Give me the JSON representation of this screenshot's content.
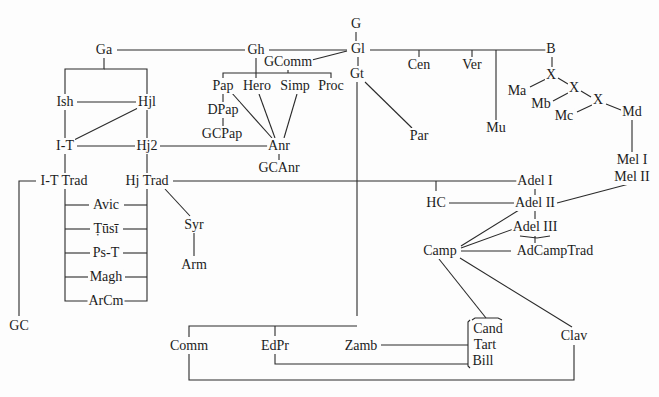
{
  "diagram": {
    "type": "stemma",
    "nodes": [
      {
        "id": "G",
        "label": "G",
        "x": 356,
        "y": 24
      },
      {
        "id": "Gl",
        "label": "Gl",
        "x": 358,
        "y": 49
      },
      {
        "id": "Gt",
        "label": "Gt",
        "x": 357,
        "y": 74
      },
      {
        "id": "Ga",
        "label": "Ga",
        "x": 104,
        "y": 50
      },
      {
        "id": "Gh",
        "label": "Gh",
        "x": 256,
        "y": 50
      },
      {
        "id": "GComm",
        "label": "GComm",
        "x": 288,
        "y": 62
      },
      {
        "id": "Cen",
        "label": "Cen",
        "x": 419,
        "y": 65
      },
      {
        "id": "Ver",
        "label": "Ver",
        "x": 472,
        "y": 65
      },
      {
        "id": "B",
        "label": "B",
        "x": 551,
        "y": 49
      },
      {
        "id": "X1",
        "label": "X",
        "x": 551,
        "y": 75
      },
      {
        "id": "X2",
        "label": "X",
        "x": 574,
        "y": 88
      },
      {
        "id": "X3",
        "label": "X",
        "x": 598,
        "y": 100
      },
      {
        "id": "Ma",
        "label": "Ma",
        "x": 517,
        "y": 91
      },
      {
        "id": "Mb",
        "label": "Mb",
        "x": 541,
        "y": 104
      },
      {
        "id": "Mc",
        "label": "Mc",
        "x": 564,
        "y": 116
      },
      {
        "id": "Md",
        "label": "Md",
        "x": 632,
        "y": 112
      },
      {
        "id": "Mu",
        "label": "Mu",
        "x": 496,
        "y": 128
      },
      {
        "id": "Par",
        "label": "Par",
        "x": 419,
        "y": 136
      },
      {
        "id": "MelI",
        "label": "Mel I",
        "x": 632,
        "y": 160
      },
      {
        "id": "MelII",
        "label": "Mel II",
        "x": 632,
        "y": 177
      },
      {
        "id": "Pap",
        "label": "Pap",
        "x": 223,
        "y": 86
      },
      {
        "id": "Hero",
        "label": "Hero",
        "x": 257,
        "y": 86
      },
      {
        "id": "Simp",
        "label": "Simp",
        "x": 295,
        "y": 86
      },
      {
        "id": "Proc",
        "label": "Proc",
        "x": 331,
        "y": 86
      },
      {
        "id": "DPap",
        "label": "DPap",
        "x": 223,
        "y": 110
      },
      {
        "id": "GCPap",
        "label": "GCPap",
        "x": 222,
        "y": 134
      },
      {
        "id": "Anr",
        "label": "Anr",
        "x": 279,
        "y": 146
      },
      {
        "id": "GCAnr",
        "label": "GCAnr",
        "x": 279,
        "y": 168
      },
      {
        "id": "Ish",
        "label": "Ish",
        "x": 65,
        "y": 102
      },
      {
        "id": "Hjl",
        "label": "Hjl",
        "x": 147,
        "y": 102
      },
      {
        "id": "IT",
        "label": "I-T",
        "x": 65,
        "y": 146
      },
      {
        "id": "Hj2",
        "label": "Hj2",
        "x": 147,
        "y": 146
      },
      {
        "id": "ITTrad",
        "label": "I-T  Trad",
        "x": 64,
        "y": 181
      },
      {
        "id": "HjTrad",
        "label": "Hj  Trad",
        "x": 147,
        "y": 181
      },
      {
        "id": "Avic",
        "label": "Avic",
        "x": 106,
        "y": 205
      },
      {
        "id": "Tusi",
        "label": "Ṭūsī",
        "x": 106,
        "y": 229
      },
      {
        "id": "PsT",
        "label": "Ps-T",
        "x": 106,
        "y": 253
      },
      {
        "id": "Magh",
        "label": "Magh",
        "x": 106,
        "y": 277
      },
      {
        "id": "ArCm",
        "label": "ArCm",
        "x": 106,
        "y": 301
      },
      {
        "id": "Syr",
        "label": "Syr",
        "x": 194,
        "y": 225
      },
      {
        "id": "Arm",
        "label": "Arm",
        "x": 194,
        "y": 265
      },
      {
        "id": "GC",
        "label": "GC",
        "x": 19,
        "y": 326
      },
      {
        "id": "AdelI",
        "label": "Adel  I",
        "x": 535,
        "y": 181
      },
      {
        "id": "AdelII",
        "label": "Adel  II",
        "x": 535,
        "y": 203
      },
      {
        "id": "AdelIII",
        "label": "Adel  III",
        "x": 535,
        "y": 227
      },
      {
        "id": "HC",
        "label": "HC",
        "x": 436,
        "y": 203
      },
      {
        "id": "Camp",
        "label": "Camp",
        "x": 440,
        "y": 251
      },
      {
        "id": "AdCampTrad",
        "label": "AdCampTrad",
        "x": 555,
        "y": 251
      },
      {
        "id": "Comm",
        "label": "Comm",
        "x": 189,
        "y": 346
      },
      {
        "id": "EdPr",
        "label": "EdPr",
        "x": 275,
        "y": 346
      },
      {
        "id": "Zamb",
        "label": "Zamb",
        "x": 361,
        "y": 346
      },
      {
        "id": "Cand",
        "label": "Cand",
        "x": 488,
        "y": 329
      },
      {
        "id": "Tart",
        "label": "Tart",
        "x": 485,
        "y": 345
      },
      {
        "id": "Bill",
        "label": "Bill",
        "x": 483,
        "y": 361
      },
      {
        "id": "Clav",
        "label": "Clav",
        "x": 574,
        "y": 336
      }
    ],
    "edges": [
      "M356,31 L356,41",
      "M358,57 L358,66",
      "M117,50 L245,50",
      "M269,50 L347,50",
      "M308,61 L347,51",
      "M370,50 L551,50 L551,41",
      "M419,50 L419,57",
      "M472,50 L472,57",
      "M496,50 L496,120",
      "M552,57 L552,69",
      "M558,78 L568,84",
      "M581,91 L591,97",
      "M530,87 L546,79",
      "M553,101 L568,93",
      "M577,112 L592,105",
      "M606,104 L621,110",
      "M632,120 L632,152",
      "M365,82 L412,128",
      "M357,82 L357,316",
      "M104,58 L104,69 L65,69 L65,94",
      "M104,69 L147,69 L147,94",
      "M77,102 L136,102",
      "M138,108 L74,140",
      "M65,110 L65,138",
      "M147,110 L147,138",
      "M77,146 L135,146",
      "M160,146 L268,146",
      "M256,58 L256,78",
      "M223,78 L223,73 L331,73 L331,78",
      "M288,70 L288,73",
      "M223,94 L223,102",
      "M223,118 L223,126",
      "M231,92 L272,138",
      "M259,94 L275,138",
      "M297,94 L284,138",
      "M279,154 L279,160",
      "M65,154 L65,173",
      "M147,154 L147,173",
      "M65,189 L65,301 L91,301",
      "M147,189 L147,301 L122,301",
      "M65,205 L89,205",
      "M124,205 L147,205",
      "M65,229 L90,229",
      "M123,229 L147,229",
      "M65,253 L90,253",
      "M123,253 L147,253",
      "M65,277 L88,277",
      "M125,277 L147,277",
      "M36,181 L19,181 L19,316",
      "M173,181 L518,181",
      "M165,189 L190,216",
      "M194,233 L194,256",
      "M436,181 L436,191",
      "M449,203 L514,203",
      "M535,187 L535,195",
      "M535,210 L535,219",
      "M557,203 L629,184",
      "M519,210 L461,246",
      "M519,227 L461,248",
      "M520,236 L537,238 L550,236",
      "M535,236 L535,243",
      "M461,251 L511,251",
      "M439,259 L486,318",
      "M460,258 L572,327",
      "M189,337 L189,326 L357,326",
      "M275,326 L275,336",
      "M189,354 L189,380 L574,380 L574,345",
      "M275,354 L275,364 L468,364",
      "M381,345 L468,345",
      "M472,320 L475,318 L498,318 L502,320",
      "M470,320 L468,322 L468,366 L470,368"
    ]
  }
}
